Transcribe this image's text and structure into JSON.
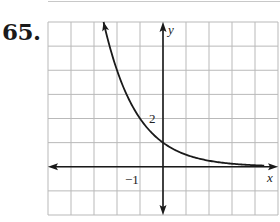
{
  "problem": {
    "number": "65."
  },
  "chart_data": {
    "type": "line",
    "title": "",
    "function": "y = 2^(-x)",
    "xlabel": "x",
    "ylabel": "y",
    "xlim": [
      -5,
      5
    ],
    "ylim": [
      -2,
      6
    ],
    "grid": true,
    "grid_step": 1,
    "tick_labels": [
      {
        "axis": "x",
        "value": -1,
        "label": "−1"
      },
      {
        "axis": "y",
        "value": 2,
        "label": "2"
      }
    ],
    "series": [
      {
        "name": "f(x)",
        "x": [
          -2.58,
          -2,
          -1.5,
          -1,
          -0.5,
          0,
          0.5,
          1,
          1.5,
          2,
          3,
          4,
          5
        ],
        "values": [
          6,
          4,
          2.83,
          2,
          1.41,
          1,
          0.71,
          0.5,
          0.35,
          0.25,
          0.125,
          0.06,
          0.03
        ]
      }
    ],
    "colors": {
      "grid": "#b9b9b9",
      "axis": "#1a1a1a",
      "curve": "#1a1a1a"
    }
  }
}
